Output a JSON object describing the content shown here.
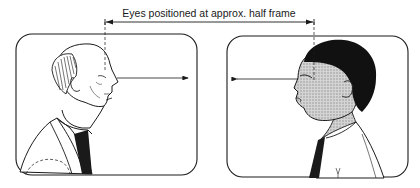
{
  "caption": {
    "text": "Eyes positioned at approx. half frame"
  },
  "frames": [
    {
      "id": "left",
      "subject": "older bald man in profile facing right",
      "gaze_direction": "right",
      "x": 16,
      "y": 34,
      "width": 181,
      "height": 141
    },
    {
      "id": "right",
      "subject": "young man with curly hair in profile facing left",
      "gaze_direction": "left",
      "x": 227,
      "y": 36,
      "width": 181,
      "height": 141
    }
  ],
  "guides": {
    "dimension_line_y": 22,
    "left_eye_x": 105,
    "right_eye_x": 314,
    "eye_line_y": 78
  },
  "colors": {
    "ink": "#1a1a1a",
    "skin_shade": "#bdbdbd",
    "background": "#ffffff"
  }
}
